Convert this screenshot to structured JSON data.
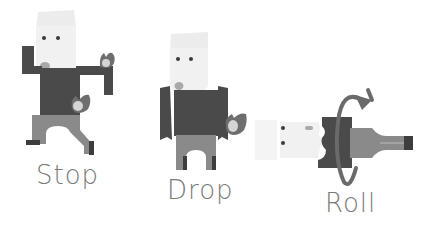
{
  "illustration": {
    "steps": [
      {
        "id": "stop",
        "label": "Stop",
        "pose": "running-with-flames"
      },
      {
        "id": "drop",
        "label": "Drop",
        "pose": "standing-arms-down"
      },
      {
        "id": "roll",
        "label": "Roll",
        "pose": "lying-horizontal-rotating"
      }
    ],
    "icons": [
      "flame-icon",
      "rotate-arrow-icon"
    ],
    "colors": {
      "skin": "#f1f1f1",
      "hair": "#ececec",
      "eye": "#3a3a3a",
      "mouth": "#a9a9a9",
      "shirt": "#4a4a4a",
      "pants": "#8a8a8a",
      "shoe": "#3d3d3d",
      "flame_outer": "#6e6e6e",
      "flame_inner": "#d5d5d5",
      "arrow": "#6a6a6a",
      "label": "#7a7a7a"
    }
  }
}
